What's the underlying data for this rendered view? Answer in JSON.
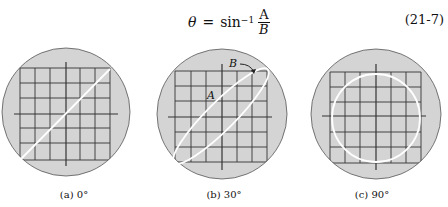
{
  "equation": {
    "lhs": "θ",
    "equals": "=",
    "func": "sin",
    "superscript": "−1",
    "numerator": "A",
    "denominator": "B",
    "number": "(21-7)"
  },
  "figures": [
    {
      "caption": "(a)  0°",
      "phase": "0°",
      "trace": "line"
    },
    {
      "caption": "(b)  30°",
      "phase": "30°",
      "trace": "ellipse",
      "label_A": "A",
      "label_B": "B"
    },
    {
      "caption": "(c)  90°",
      "phase": "90°",
      "trace": "circle"
    }
  ],
  "colors": {
    "screen": "#d4d4d4",
    "grid": "#222222",
    "trace": "#ffffff"
  }
}
